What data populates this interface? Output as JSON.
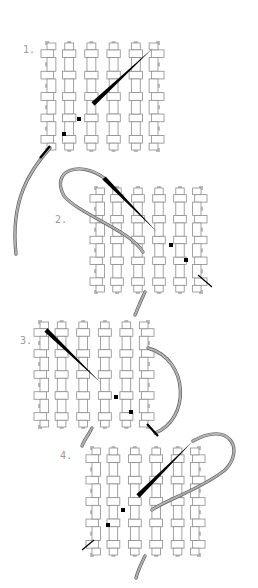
{
  "diagram": {
    "type": "needlework-instructions",
    "colors": {
      "background": "#ffffff",
      "canvas_fill": "#ffffff",
      "canvas_outline": "#8c8c8c",
      "needle": "#000000",
      "thread_outer": "#6e6e6e",
      "thread_inner": "#d8d8d8",
      "label": "#9a9a9a",
      "stitch_dot": "#000000"
    },
    "steps": [
      {
        "label": "1.",
        "label_pos": [
          25,
          52
        ],
        "grid": {
          "x": 47,
          "y": 43,
          "w": 111,
          "h": 107
        },
        "needle": {
          "from": [
            93,
            104
          ],
          "to": [
            153,
            48
          ],
          "thread_side": "under"
        },
        "stitch_dots": [
          [
            79,
            119
          ],
          [
            64,
            134
          ]
        ],
        "thread": "M50 148 C 30 170, 10 200, 16 254"
      },
      {
        "label": "2.",
        "label_pos": [
          57,
          222
        ],
        "grid": {
          "x": 96,
          "y": 188,
          "w": 105,
          "h": 104
        },
        "needle": {
          "from": [
            104,
            178
          ],
          "to": [
            157,
            232
          ],
          "thread_side": "loop"
        },
        "stitch_dots": [
          [
            171,
            245
          ],
          [
            186,
            260
          ]
        ],
        "thread": "M104 178 C 80 160, 50 170, 64 196 C 80 215, 130 230, 143 252"
      },
      {
        "label": "3.",
        "label_pos": [
          22,
          343
        ],
        "grid": {
          "x": 40,
          "y": 322,
          "w": 108,
          "h": 105
        },
        "needle": {
          "from": [
            46,
            330
          ],
          "to": [
            101,
            383
          ],
          "thread_side": "over"
        },
        "stitch_dots": [
          [
            116,
            397
          ],
          [
            131,
            412
          ]
        ],
        "thread": "M148 348 C 190 360, 190 420, 155 433"
      },
      {
        "label": "4.",
        "label_pos": [
          62,
          458
        ],
        "grid": {
          "x": 92,
          "y": 448,
          "w": 107,
          "h": 107
        },
        "needle": {
          "from": [
            138,
            496
          ],
          "to": [
            193,
            441
          ],
          "thread_side": "loop"
        },
        "stitch_dots": [
          [
            123,
            510
          ],
          [
            108,
            525
          ]
        ],
        "thread": "M193 441 C 230 420, 245 450, 225 470 C 200 490, 165 500, 152 510"
      }
    ]
  }
}
